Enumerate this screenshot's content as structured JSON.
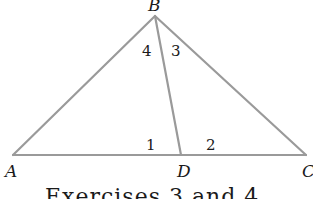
{
  "diagram": {
    "type": "triangle",
    "stroke_color": "#9a9a9a",
    "points": {
      "A": {
        "label": "A",
        "x": 13,
        "y": 155
      },
      "B": {
        "label": "B",
        "x": 155,
        "y": 16
      },
      "C": {
        "label": "C",
        "x": 306,
        "y": 155
      },
      "D": {
        "label": "D",
        "x": 181,
        "y": 155
      }
    },
    "segments": [
      "AB",
      "BC",
      "AC",
      "BD"
    ],
    "angle_labels": [
      {
        "label": "4",
        "at": "B",
        "side": "ABD"
      },
      {
        "label": "3",
        "at": "B",
        "side": "DBC"
      },
      {
        "label": "1",
        "at": "D",
        "side": "ADB"
      },
      {
        "label": "2",
        "at": "D",
        "side": "BDC"
      }
    ],
    "caption": "Exercises 3 and 4"
  }
}
